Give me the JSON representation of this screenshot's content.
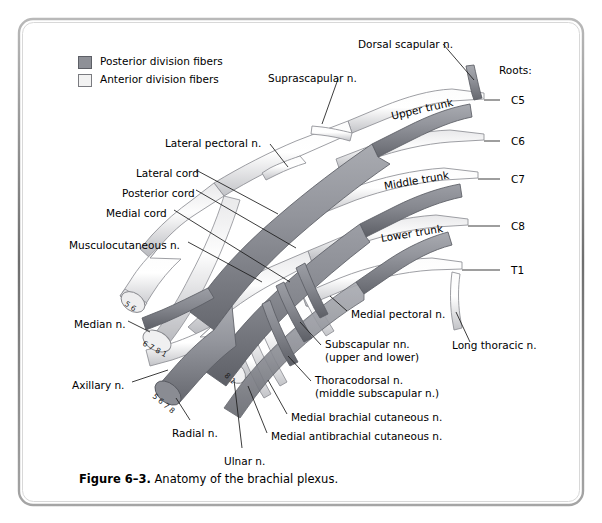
{
  "figure": {
    "caption_number": "Figure 6–3.",
    "caption_text": " Anatomy of the brachial plexus.",
    "border_color": "#8c8c8c",
    "background": "#ffffff"
  },
  "legend": {
    "items": [
      {
        "label": "Posterior division fibers",
        "color": "#8e9097",
        "x": 78,
        "y": 58
      },
      {
        "label": "Anterior division fibers",
        "color": "#f2f2f2",
        "x": 78,
        "y": 76
      }
    ]
  },
  "roots": {
    "heading": "Roots:",
    "heading_x": 499,
    "heading_y": 64,
    "items": [
      {
        "label": "C5",
        "x": 511,
        "y": 95,
        "tick_x1": 484,
        "tick_x2": 500,
        "tick_y": 100
      },
      {
        "label": "C6",
        "x": 511,
        "y": 136,
        "tick_x1": 484,
        "tick_x2": 500,
        "tick_y": 141
      },
      {
        "label": "C7",
        "x": 511,
        "y": 174,
        "tick_x1": 478,
        "tick_x2": 500,
        "tick_y": 179
      },
      {
        "label": "C8",
        "x": 511,
        "y": 221,
        "tick_x1": 468,
        "tick_x2": 500,
        "tick_y": 226
      },
      {
        "label": "T1",
        "x": 511,
        "y": 265,
        "tick_x1": 462,
        "tick_x2": 500,
        "tick_y": 270
      }
    ]
  },
  "trunks": [
    {
      "label": "Upper trunk",
      "x": 390,
      "y": 110,
      "rotate": -13
    },
    {
      "label": "Middle trunk",
      "x": 383,
      "y": 180,
      "rotate": -10
    },
    {
      "label": "Lower trunk",
      "x": 380,
      "y": 232,
      "rotate": -9
    }
  ],
  "labels": [
    {
      "name": "dorsal-scapular-n",
      "text": "Dorsal scapular n.",
      "x": 358,
      "y": 38
    },
    {
      "name": "suprascapular-n",
      "text": "Suprascapular n.",
      "x": 268,
      "y": 72
    },
    {
      "name": "lateral-pectoral-n",
      "text": "Lateral pectoral n.",
      "x": 165,
      "y": 137
    },
    {
      "name": "lateral-cord",
      "text": "Lateral cord",
      "x": 136,
      "y": 167
    },
    {
      "name": "posterior-cord",
      "text": "Posterior cord",
      "x": 122,
      "y": 187
    },
    {
      "name": "medial-cord",
      "text": "Medial cord",
      "x": 106,
      "y": 207
    },
    {
      "name": "musculocutaneous-n",
      "text": "Musculocutaneous n.",
      "x": 69,
      "y": 239
    },
    {
      "name": "median-n",
      "text": "Median n.",
      "x": 74,
      "y": 318
    },
    {
      "name": "axillary-n",
      "text": "Axillary n.",
      "x": 72,
      "y": 379
    },
    {
      "name": "radial-n",
      "text": "Radial n.",
      "x": 172,
      "y": 427
    },
    {
      "name": "ulnar-n",
      "text": "Ulnar n.",
      "x": 224,
      "y": 455
    },
    {
      "name": "medial-pectoral-n",
      "text": "Medial pectoral n.",
      "x": 351,
      "y": 308
    },
    {
      "name": "long-thoracic-n",
      "text": "Long thoracic n.",
      "x": 452,
      "y": 339
    },
    {
      "name": "medial-brachial-cutaneous-n",
      "text": "Medial brachial cutaneous n.",
      "x": 291,
      "y": 411
    },
    {
      "name": "medial-antibrachial-cutaneous-n",
      "text": "Medial antibrachial cutaneous n.",
      "x": 271,
      "y": 430
    }
  ],
  "labels_two_line": [
    {
      "name": "subscapular-nn",
      "line1": "Subscapular nn.",
      "line2": "(upper and lower)",
      "x": 325,
      "y": 342
    },
    {
      "name": "thoracodorsal-n",
      "line1": "Thoracodorsal n.",
      "line2": "(middle subscapular n.)",
      "x": 315,
      "y": 378
    }
  ],
  "nerve_end_numbers": [
    {
      "name": "musculocutaneous-roots",
      "values": "5 6",
      "x": 129,
      "y": 302
    },
    {
      "name": "median-roots",
      "values": "6 7 8 1",
      "x": 152,
      "y": 340
    },
    {
      "name": "radial-roots",
      "values": "5 6 7 8",
      "x": 156,
      "y": 383
    },
    {
      "name": "ulnar-roots",
      "values": "8 1",
      "x": 226,
      "y": 382
    }
  ],
  "colors": {
    "posterior_fiber": "#8e9097",
    "posterior_fiber_dark": "#6f7178",
    "anterior_fiber": "#f4f4f5",
    "anterior_fiber_edge": "#9a9a9e",
    "outline": "#5a5a5e",
    "leader_line": "#1a1a1a"
  }
}
